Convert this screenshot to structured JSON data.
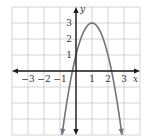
{
  "chart_data": {
    "type": "line",
    "title": "",
    "xlabel": "x",
    "ylabel": "y",
    "xlim": [
      -4,
      4
    ],
    "ylim": [
      -4,
      4
    ],
    "grid": true,
    "x_ticks": [
      {
        "value": -3,
        "label": "−3"
      },
      {
        "value": -2,
        "label": "−2"
      },
      {
        "value": -1,
        "label": "−1"
      },
      {
        "value": 1,
        "label": "1"
      },
      {
        "value": 2,
        "label": "2"
      },
      {
        "value": 3,
        "label": "3"
      }
    ],
    "y_ticks": [
      {
        "value": 1,
        "label": "1"
      },
      {
        "value": 2,
        "label": "2"
      },
      {
        "value": 3,
        "label": "3"
      }
    ],
    "series": [
      {
        "name": "parabola",
        "equation": "y = -2(x-1)^2 + 3",
        "vertex": [
          1,
          3
        ],
        "y_intercept": 1,
        "x_intercepts": [
          -0.22,
          2.22
        ],
        "x": [
          -0.87,
          -0.5,
          0,
          0.5,
          1,
          1.5,
          2,
          2.5,
          2.87
        ],
        "y": [
          -4,
          -1.5,
          1,
          2.5,
          3,
          2.5,
          1,
          -1.5,
          -4
        ],
        "color": "#7a6f7e"
      }
    ]
  },
  "colors": {
    "grid": "#c8c8c8",
    "axis": "#1a1a1a",
    "curve": "#7a6f7e"
  }
}
